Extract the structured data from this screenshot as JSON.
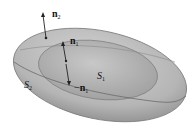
{
  "diagram": {
    "type": "nested-surfaces",
    "colors": {
      "outer_fill": "#b9b9b9",
      "inner_fill": "#a9a9a9",
      "edge": "#6d6d6d",
      "arrow": "#222222"
    },
    "labels": {
      "n2": {
        "base": "n",
        "sub": "2"
      },
      "n1_upper": {
        "base": "n",
        "sub": "1"
      },
      "n1_lower": {
        "prefix": "−",
        "base": "n",
        "sub": "1"
      },
      "S1": {
        "base": "S",
        "sub": "1"
      },
      "S2": {
        "base": "S",
        "sub": "2"
      }
    }
  }
}
